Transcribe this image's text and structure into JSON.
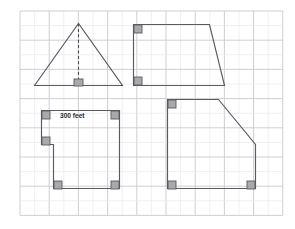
{
  "worksheet": {
    "title": "Geometry figures on grid paper",
    "background_color": "#ffffff",
    "grid": {
      "minor_color": "#e9e9ec",
      "major_color": "#c9c9cf",
      "cell_size": 14.6,
      "origin_x": 20,
      "origin_y": 11,
      "columns": 18,
      "rows": 14,
      "visible": true
    },
    "shape_stroke_color": "#5a5a60",
    "right_angle_marker_color": "#a9a9ad"
  },
  "labels": {
    "length_label": "300 feet"
  },
  "figures": [
    {
      "id": "triangle",
      "name": "triangle-with-altitude",
      "position": "top-left",
      "kind": "triangle",
      "points": "34.5,85.5 78.5,23.5 122.5,85.5",
      "altitude": {
        "x1": 78.5,
        "y1": 23.5,
        "x2": 78.5,
        "y2": 85.5,
        "style": "dashed"
      },
      "right_angles": [
        {
          "x": 74,
          "y": 79,
          "w": 9,
          "h": 7
        }
      ]
    },
    {
      "id": "trapezoid",
      "name": "right-trapezoid",
      "position": "top-right",
      "kind": "trapezoid",
      "points": "133.5,24.5 209.5,24.5 224.5,85.5 133.5,85.5",
      "right_angles": [
        {
          "x": 134,
          "y": 25,
          "w": 8,
          "h": 8
        },
        {
          "x": 134,
          "y": 77,
          "w": 8,
          "h": 8
        }
      ]
    },
    {
      "id": "notched-rectangle",
      "name": "l-shaped-polygon",
      "position": "bottom-left",
      "kind": "hexagon",
      "points": "41.5,110.5 119.5,110.5 119.5,188.5 53.5,188.5 53.5,144.5 41.5,144.5",
      "right_angles": [
        {
          "x": 42,
          "y": 111,
          "w": 8,
          "h": 8
        },
        {
          "x": 111,
          "y": 111,
          "w": 8,
          "h": 8
        },
        {
          "x": 42,
          "y": 137,
          "w": 8,
          "h": 8
        },
        {
          "x": 54,
          "y": 181,
          "w": 8,
          "h": 8
        },
        {
          "x": 111,
          "y": 181,
          "w": 8,
          "h": 8
        }
      ]
    },
    {
      "id": "clipped-square",
      "name": "pentagon-with-bevel",
      "position": "bottom-right",
      "kind": "pentagon",
      "points": "167.5,99.5 218.5,99.5 255.5,144.5 255.5,188.5 167.5,188.5",
      "right_angles": [
        {
          "x": 168,
          "y": 100,
          "w": 8,
          "h": 8
        },
        {
          "x": 168,
          "y": 181,
          "w": 8,
          "h": 8
        },
        {
          "x": 247,
          "y": 181,
          "w": 8,
          "h": 8
        }
      ]
    }
  ]
}
